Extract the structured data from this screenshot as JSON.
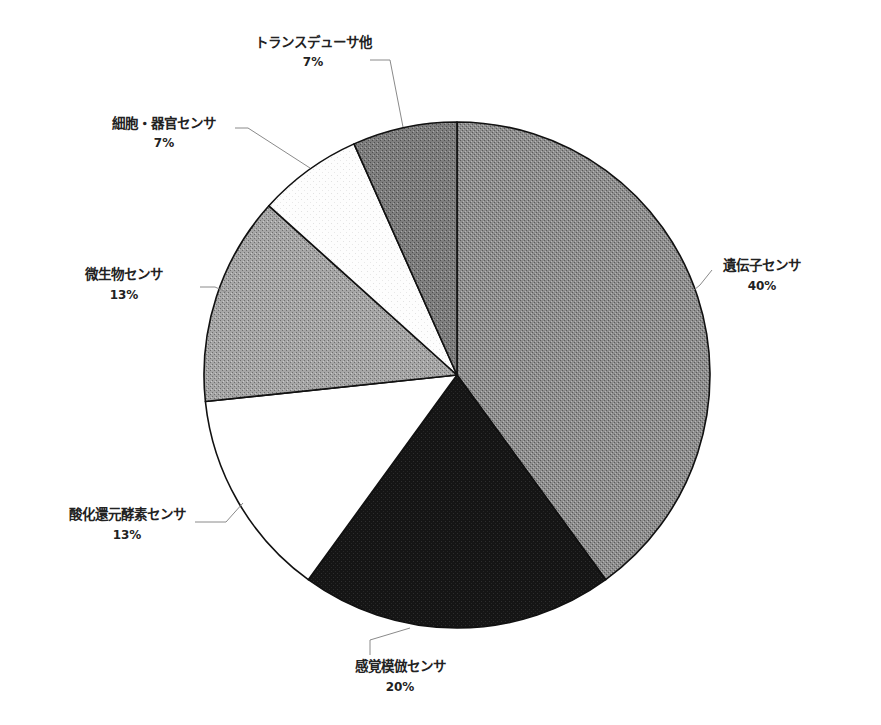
{
  "chart_data": {
    "type": "pie",
    "title": "",
    "start_angle": "12 o'clock",
    "direction": "clockwise",
    "legend": "none (data labels with leader lines)",
    "slices": [
      {
        "label": "遺伝子センサ",
        "value": 40,
        "display": "40%",
        "fill": "#8c8c8c",
        "texture": "stipple"
      },
      {
        "label": "感覚模倣センサ",
        "value": 20,
        "display": "20%",
        "fill": "#141414",
        "texture": "stipple"
      },
      {
        "label": "酸化還元酵素センサ",
        "value": 13.33,
        "display": "13%",
        "fill": "#ffffff",
        "texture": "none"
      },
      {
        "label": "微生物センサ",
        "value": 13.33,
        "display": "13%",
        "fill": "#a3a3a3",
        "texture": "stipple"
      },
      {
        "label": "細胞・器官センサ",
        "value": 6.67,
        "display": "7%",
        "fill": "#fbfbfb",
        "texture": "light-stipple"
      },
      {
        "label": "トランスデューサ他",
        "value": 6.67,
        "display": "7%",
        "fill": "#7e7e7e",
        "texture": "stipple"
      }
    ],
    "categories": [
      "遺伝子センサ",
      "感覚模倣センサ",
      "酸化還元酵素センサ",
      "微生物センサ",
      "細胞・器官センサ",
      "トランスデューサ他"
    ],
    "values": [
      40,
      20,
      13,
      13,
      7,
      7
    ]
  },
  "labels": {
    "s0": {
      "name": "遺伝子センサ",
      "pct": "40%"
    },
    "s1": {
      "name": "感覚模倣センサ",
      "pct": "20%"
    },
    "s2": {
      "name": "酸化還元酵素センサ",
      "pct": "13%"
    },
    "s3": {
      "name": "微生物センサ",
      "pct": "13%"
    },
    "s4": {
      "name": "細胞・器官センサ",
      "pct": "7%"
    },
    "s5": {
      "name": "トランスデューサ他",
      "pct": "7%"
    }
  }
}
